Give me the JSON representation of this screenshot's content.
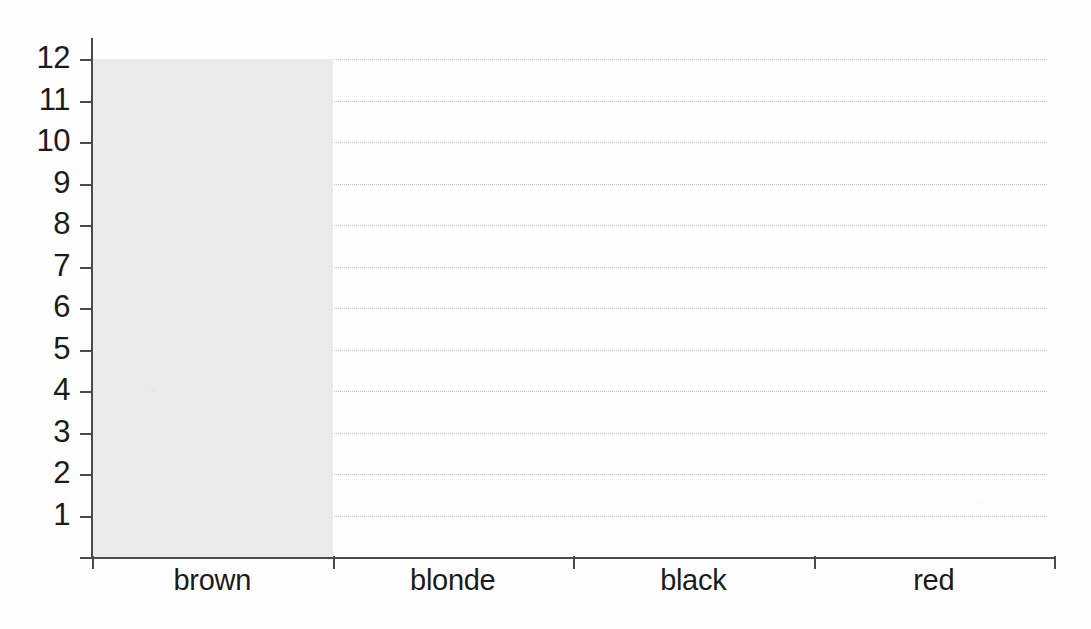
{
  "chart_data": {
    "type": "bar",
    "title": "",
    "subtitle": "",
    "xlabel": "",
    "ylabel": "",
    "categories": [
      "brown",
      "blonde",
      "black",
      "red"
    ],
    "values": [
      12,
      0,
      0,
      0
    ],
    "series": [
      {
        "name": "count",
        "values": [
          12,
          0,
          0,
          0
        ]
      }
    ],
    "ylim": [
      0,
      12
    ],
    "y_ticks": [
      1,
      2,
      3,
      4,
      5,
      6,
      7,
      8,
      9,
      10,
      11,
      12
    ],
    "y_tick_labels": [
      "1",
      "2",
      "3",
      "4",
      "5",
      "6",
      "7",
      "8",
      "9",
      "10",
      "11",
      "12"
    ],
    "grid": true,
    "grid_axis": "y",
    "grid_style": "dotted",
    "legend": false,
    "legend_position": "none",
    "bar_fill_color": "#eaeaea",
    "axis_color": "#4a4a4a",
    "gridline_color": "#c3c3c3",
    "text_color": "#1b1b1b",
    "background_color": "#fefefe"
  },
  "axes": {
    "y": {
      "ticks": [
        {
          "label": "12",
          "value": 12
        },
        {
          "label": "11",
          "value": 11
        },
        {
          "label": "10",
          "value": 10
        },
        {
          "label": "9",
          "value": 9
        },
        {
          "label": "8",
          "value": 8
        },
        {
          "label": "7",
          "value": 7
        },
        {
          "label": "6",
          "value": 6
        },
        {
          "label": "5",
          "value": 5
        },
        {
          "label": "4",
          "value": 4
        },
        {
          "label": "3",
          "value": 3
        },
        {
          "label": "2",
          "value": 2
        },
        {
          "label": "1",
          "value": 1
        }
      ]
    },
    "x": {
      "categories": [
        {
          "label": "brown"
        },
        {
          "label": "blonde"
        },
        {
          "label": "black"
        },
        {
          "label": "red"
        }
      ]
    }
  }
}
